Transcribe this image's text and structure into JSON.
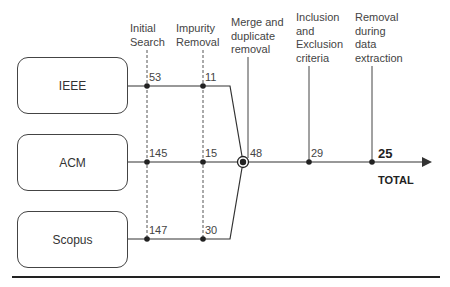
{
  "sources": [
    {
      "label": "IEEE"
    },
    {
      "label": "ACM"
    },
    {
      "label": "Scopus"
    }
  ],
  "stages": [
    {
      "label": "Initial\nSearch"
    },
    {
      "label": "Impurity\nRemoval"
    },
    {
      "label": "Merge and\nduplicate\nremoval"
    },
    {
      "label": "Inclusion\nand\nExclusion\ncriteria"
    },
    {
      "label": "Removal\nduring\ndata\nextraction"
    }
  ],
  "counts": {
    "ieee_initial": "53",
    "ieee_impurity": "11",
    "acm_initial": "145",
    "acm_impurity": "15",
    "scopus_initial": "147",
    "scopus_impurity": "30",
    "merged": "48",
    "inclusion": "29",
    "final": "25"
  },
  "total_label": "TOTAL",
  "colors": {
    "line": "#333333",
    "dashed": "#555555"
  }
}
